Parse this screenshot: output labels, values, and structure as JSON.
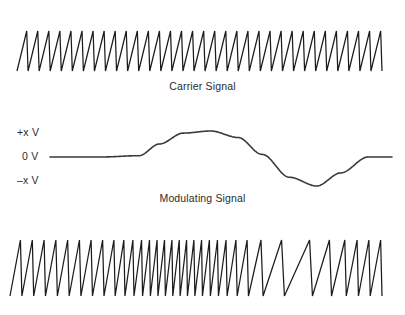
{
  "figure": {
    "background_color": "#ffffff",
    "stroke_color": "#1c1c1c",
    "modulating_stroke_color": "#3a3a3a"
  },
  "carrier": {
    "caption": "Carrier Signal",
    "x_start": 17,
    "x_end": 382,
    "y_top": 31,
    "y_bottom": 71,
    "cycles": 33,
    "waveform": "sawtooth-rising"
  },
  "modulating": {
    "caption": "Modulating Signal",
    "axis_labels": {
      "positive": "+x V",
      "zero": "0 V",
      "negative": "–x V"
    },
    "baseline_y": 47,
    "peak_y": 21,
    "trough_y": 76,
    "x_start": 50,
    "x_end": 392,
    "waveform": "smoothed-sine-single-cycle",
    "flat_lead_until_x": 105,
    "rise_start_x": 105,
    "peak_x": 158,
    "zero_cross_x": 213,
    "trough_x": 272,
    "settle_x": 327
  },
  "modulated": {
    "x_start": 10,
    "x_end": 382,
    "y_top": 240,
    "y_bottom": 296,
    "waveform": "sawtooth-fm",
    "description": "Carrier sawtooth with frequency proportional to modulating voltage; highest frequency under the modulating peak, lowest under the trough.",
    "base_cycles": 33,
    "deviation": 0.62
  },
  "chart_data": {
    "type": "line",
    "xlabel": "",
    "ylabel": "Voltage",
    "grid": false,
    "legend_position": "none",
    "panels": [
      {
        "name": "Carrier Signal",
        "label": "Carrier Signal",
        "waveform": "sawtooth",
        "cycles": 33,
        "amplitude": 1.0,
        "frequency_constant": true
      },
      {
        "name": "Modulating Signal",
        "label": "Modulating Signal",
        "waveform": "sine",
        "cycles": 1,
        "amplitude": 1.0,
        "tick_labels": [
          "+x V",
          "0 V",
          "–x V"
        ],
        "x": [
          0,
          0.15,
          0.26,
          0.32,
          0.39,
          0.47,
          0.55,
          0.62,
          0.7,
          0.78,
          0.85,
          0.93,
          1.0
        ],
        "y": [
          0,
          0,
          0.05,
          0.5,
          0.92,
          1.0,
          0.75,
          0.1,
          -0.7,
          -1.0,
          -0.55,
          0.0,
          0.0
        ]
      },
      {
        "name": "Modulated Signal",
        "label": "",
        "waveform": "sawtooth-fm",
        "cycles": 33,
        "amplitude": 1.0,
        "frequency_constant": false,
        "instantaneous_frequency": [
          1.0,
          1.0,
          1.05,
          1.5,
          1.9,
          2.0,
          1.75,
          1.1,
          0.4,
          0.2,
          0.5,
          1.0,
          1.0
        ]
      }
    ]
  }
}
